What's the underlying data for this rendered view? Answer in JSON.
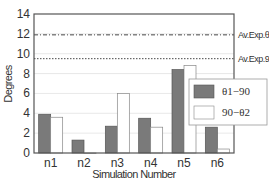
{
  "chart_data": {
    "type": "bar",
    "title": "",
    "xlabel": "Simulation Number",
    "ylabel": "Degrees",
    "ylim": [
      0,
      14
    ],
    "yticks": [
      0,
      2,
      4,
      6,
      8,
      10,
      12,
      14
    ],
    "grid": true,
    "legend_position": "right-inside",
    "categories": [
      "n1",
      "n2",
      "n3",
      "n4",
      "n5",
      "n6"
    ],
    "series": [
      {
        "name": "θ1−90",
        "color": "#7a7a7a",
        "values": [
          3.9,
          1.3,
          2.7,
          3.5,
          8.4,
          2.6
        ]
      },
      {
        "name": "90−θ2",
        "color": "#ffffff",
        "values": [
          3.6,
          0.0,
          6.0,
          2.6,
          8.8,
          0.4
        ]
      }
    ],
    "reference_lines": [
      {
        "label": "Av.Exp.θ1-90",
        "value": 11.9,
        "style": "dash-dot"
      },
      {
        "label": "Av.Exp.90-θ2",
        "value": 9.5,
        "style": "dotted"
      }
    ]
  }
}
